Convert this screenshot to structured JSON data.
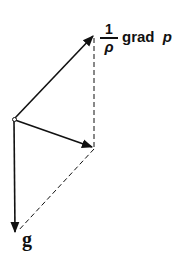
{
  "diagram": {
    "labels": {
      "force_numerator": "1",
      "force_denominator": "ρ",
      "force_rest": "grad",
      "force_var": "p",
      "gravity": "g"
    },
    "colors": {
      "line": "#111111",
      "background": "#ffffff"
    }
  }
}
